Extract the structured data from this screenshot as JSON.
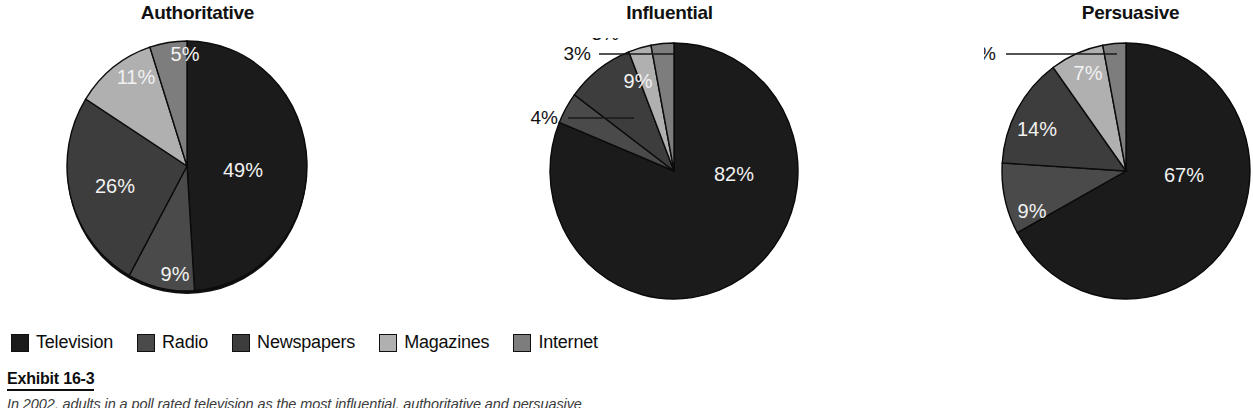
{
  "exhibit": {
    "label": "Exhibit 16-3",
    "caption": "In 2002, adults in a poll rated television as the most influential, authoritative and persuasive"
  },
  "legend": {
    "items": [
      {
        "label": "Television",
        "color": "#1b1b1b"
      },
      {
        "label": "Radio",
        "color": "#4a4a4a"
      },
      {
        "label": "Newspapers",
        "color": "#3d3d3d"
      },
      {
        "label": "Magazines",
        "color": "#b0b0b0"
      },
      {
        "label": "Internet",
        "color": "#7d7d7d"
      }
    ]
  },
  "chart_data": [
    {
      "type": "pie",
      "title": "Authoritative",
      "categories": [
        "Television",
        "Radio",
        "Newspapers",
        "Magazines",
        "Internet"
      ],
      "values": [
        49,
        9,
        26,
        11,
        5
      ],
      "labels": [
        "49%",
        "9%",
        "26%",
        "11%",
        "5%"
      ],
      "colors": [
        "#1b1b1b",
        "#4a4a4a",
        "#3d3d3d",
        "#b0b0b0",
        "#7d7d7d"
      ],
      "label_placement": [
        "inside",
        "inside",
        "inside",
        "inside",
        "inside"
      ],
      "start_angle": 0,
      "direction": "clockwise",
      "units": "percent"
    },
    {
      "type": "pie",
      "title": "Influential",
      "categories": [
        "Television",
        "Radio",
        "Newspapers",
        "Magazines",
        "Internet"
      ],
      "values": [
        82,
        4,
        9,
        3,
        3
      ],
      "labels": [
        "82%",
        "4%",
        "9%",
        "3%",
        "3%"
      ],
      "colors": [
        "#1b1b1b",
        "#4a4a4a",
        "#3d3d3d",
        "#b0b0b0",
        "#7d7d7d"
      ],
      "label_placement": [
        "inside",
        "leader",
        "inside",
        "leader",
        "leader"
      ],
      "start_angle": 0,
      "direction": "clockwise",
      "units": "percent"
    },
    {
      "type": "pie",
      "title": "Persuasive",
      "categories": [
        "Television",
        "Radio",
        "Newspapers",
        "Magazines",
        "Internet"
      ],
      "values": [
        67,
        9,
        14,
        7,
        3
      ],
      "labels": [
        "67%",
        "9%",
        "14%",
        "7%",
        "3%"
      ],
      "colors": [
        "#1b1b1b",
        "#4a4a4a",
        "#3d3d3d",
        "#b0b0b0",
        "#7d7d7d"
      ],
      "label_placement": [
        "inside",
        "inside",
        "inside",
        "inside",
        "leader"
      ],
      "start_angle": 0,
      "direction": "clockwise",
      "units": "percent"
    }
  ]
}
